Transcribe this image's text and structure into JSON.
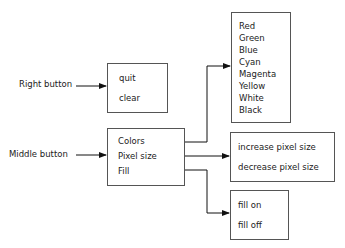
{
  "inputs": {
    "right_button": "Right button",
    "middle_button": "Middle button"
  },
  "menus": {
    "right_menu": {
      "items": [
        "quit",
        "clear"
      ]
    },
    "middle_menu": {
      "items": [
        "Colors",
        "Pixel size",
        "Fill"
      ]
    },
    "colors_menu": {
      "items": [
        "Red",
        "Green",
        "Blue",
        "Cyan",
        "Magenta",
        "Yellow",
        "White",
        "Black"
      ]
    },
    "pixel_size_menu": {
      "items": [
        "increase pixel size",
        "decrease pixel size"
      ]
    },
    "fill_menu": {
      "items": [
        "fill on",
        "fill off"
      ]
    }
  }
}
